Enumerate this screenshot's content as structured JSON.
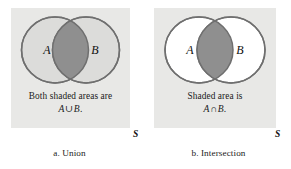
{
  "figure": {
    "background_color": "#ffffff",
    "panel_background": "#e8e8e6",
    "circle_stroke": "#6f6f6f",
    "circle_fill_shaded": "#dcdcda",
    "circle_fill_plain": "#ffffff",
    "lens_fill": "#8f8f8f"
  },
  "panels": [
    {
      "id": "union",
      "set_label_left": "A",
      "set_label_right": "B",
      "universal_set_label": "S",
      "description_line1": "Both shaded areas are",
      "description_line2_left": "A",
      "description_line2_op": "∪",
      "description_line2_right": "B",
      "description_line2_tail": ".",
      "caption": "a. Union"
    },
    {
      "id": "intersection",
      "set_label_left": "A",
      "set_label_right": "B",
      "universal_set_label": "S",
      "description_line1": "Shaded area is",
      "description_line2_left": "A",
      "description_line2_op": "∩",
      "description_line2_right": "B",
      "description_line2_tail": ".",
      "caption": "b. Intersection"
    }
  ]
}
